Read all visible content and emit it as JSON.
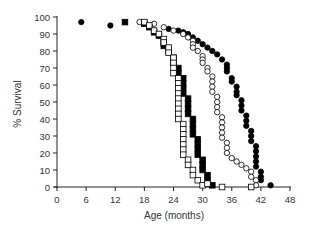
{
  "chart_data": {
    "type": "scatter",
    "subtype": "survival-step-markers",
    "title": "",
    "xlabel": "Age (months)",
    "ylabel": "% Survival",
    "xlim": [
      0,
      48
    ],
    "ylim": [
      0,
      100
    ],
    "xticks": [
      0,
      6,
      12,
      18,
      24,
      30,
      36,
      42,
      48
    ],
    "yticks": [
      0,
      10,
      20,
      30,
      40,
      50,
      60,
      70,
      80,
      90,
      100
    ],
    "grid": false,
    "legend": "none",
    "series": [
      {
        "name": "filled circles",
        "marker": "circle",
        "fill": "#000000",
        "points": [
          [
            5,
            97
          ],
          [
            11,
            95
          ],
          [
            23,
            93
          ],
          [
            25,
            92
          ],
          [
            26,
            91
          ],
          [
            27,
            90
          ],
          [
            28,
            88
          ],
          [
            29,
            86
          ],
          [
            30,
            84
          ],
          [
            31,
            82
          ],
          [
            32,
            80
          ],
          [
            33,
            78
          ],
          [
            34,
            75
          ],
          [
            35,
            72
          ],
          [
            35,
            70
          ],
          [
            35,
            68
          ],
          [
            36,
            64
          ],
          [
            36,
            62
          ],
          [
            37,
            59
          ],
          [
            37,
            56
          ],
          [
            37,
            54
          ],
          [
            38,
            51
          ],
          [
            38,
            48
          ],
          [
            38,
            45
          ],
          [
            39,
            42
          ],
          [
            39,
            39
          ],
          [
            39,
            36
          ],
          [
            40,
            33
          ],
          [
            40,
            30
          ],
          [
            40,
            27
          ],
          [
            41,
            24
          ],
          [
            41,
            21
          ],
          [
            41,
            18
          ],
          [
            41,
            15
          ],
          [
            41,
            12
          ],
          [
            42,
            9
          ],
          [
            42,
            6
          ],
          [
            42,
            4
          ],
          [
            44,
            1
          ]
        ]
      },
      {
        "name": "open circles",
        "marker": "circle",
        "fill": "#ffffff",
        "points": [
          [
            17,
            97
          ],
          [
            20,
            96
          ],
          [
            22,
            94
          ],
          [
            24,
            92
          ],
          [
            26,
            90
          ],
          [
            27,
            88
          ],
          [
            28,
            86
          ],
          [
            28,
            84
          ],
          [
            28,
            82
          ],
          [
            29,
            80
          ],
          [
            30,
            77
          ],
          [
            30,
            75
          ],
          [
            30,
            73
          ],
          [
            31,
            70
          ],
          [
            31,
            68
          ],
          [
            32,
            65
          ],
          [
            32,
            62
          ],
          [
            32,
            59
          ],
          [
            32,
            56
          ],
          [
            33,
            53
          ],
          [
            33,
            50
          ],
          [
            33,
            47
          ],
          [
            33,
            44
          ],
          [
            34,
            41
          ],
          [
            34,
            38
          ],
          [
            34,
            35
          ],
          [
            34,
            32
          ],
          [
            34,
            29
          ],
          [
            35,
            26
          ],
          [
            35,
            23
          ],
          [
            35,
            20
          ],
          [
            36,
            17
          ],
          [
            37,
            15
          ],
          [
            38,
            13
          ],
          [
            39,
            11
          ],
          [
            40,
            9
          ],
          [
            40,
            6
          ],
          [
            41,
            4
          ],
          [
            41,
            1
          ]
        ]
      },
      {
        "name": "filled squares",
        "marker": "square",
        "fill": "#000000",
        "points": [
          [
            14,
            97
          ],
          [
            18,
            96
          ],
          [
            19,
            94
          ],
          [
            20,
            91
          ],
          [
            21,
            89
          ],
          [
            22,
            85
          ],
          [
            22,
            83
          ],
          [
            23,
            80
          ],
          [
            24,
            76
          ],
          [
            24,
            73
          ],
          [
            25,
            70
          ],
          [
            25,
            67
          ],
          [
            26,
            64
          ],
          [
            26,
            61
          ],
          [
            26,
            58
          ],
          [
            26,
            55
          ],
          [
            27,
            52
          ],
          [
            27,
            49
          ],
          [
            27,
            46
          ],
          [
            27,
            43
          ],
          [
            28,
            40
          ],
          [
            28,
            37
          ],
          [
            28,
            34
          ],
          [
            28,
            31
          ],
          [
            29,
            28
          ],
          [
            29,
            25
          ],
          [
            29,
            22
          ],
          [
            29,
            19
          ],
          [
            30,
            16
          ],
          [
            30,
            13
          ],
          [
            30,
            10
          ],
          [
            31,
            7
          ],
          [
            31,
            4
          ],
          [
            32,
            1
          ]
        ]
      },
      {
        "name": "open squares",
        "marker": "square",
        "fill": "#ffffff",
        "points": [
          [
            18,
            97
          ],
          [
            19,
            95
          ],
          [
            20,
            92
          ],
          [
            21,
            90
          ],
          [
            22,
            87
          ],
          [
            22,
            85
          ],
          [
            23,
            82
          ],
          [
            23,
            79
          ],
          [
            24,
            76
          ],
          [
            24,
            73
          ],
          [
            24,
            70
          ],
          [
            24,
            67
          ],
          [
            25,
            64
          ],
          [
            25,
            61
          ],
          [
            25,
            58
          ],
          [
            25,
            55
          ],
          [
            25,
            52
          ],
          [
            25,
            49
          ],
          [
            25,
            46
          ],
          [
            25,
            43
          ],
          [
            25,
            40
          ],
          [
            26,
            37
          ],
          [
            26,
            34
          ],
          [
            26,
            31
          ],
          [
            26,
            28
          ],
          [
            26,
            25
          ],
          [
            26,
            22
          ],
          [
            26,
            19
          ],
          [
            27,
            16
          ],
          [
            27,
            13
          ],
          [
            28,
            10
          ],
          [
            28,
            7
          ],
          [
            29,
            4
          ],
          [
            30,
            1
          ],
          [
            31,
            2
          ],
          [
            34,
            0
          ],
          [
            40,
            0
          ]
        ]
      }
    ]
  },
  "axes": {
    "x_title": "Age (months)",
    "y_title": "% Survival"
  }
}
